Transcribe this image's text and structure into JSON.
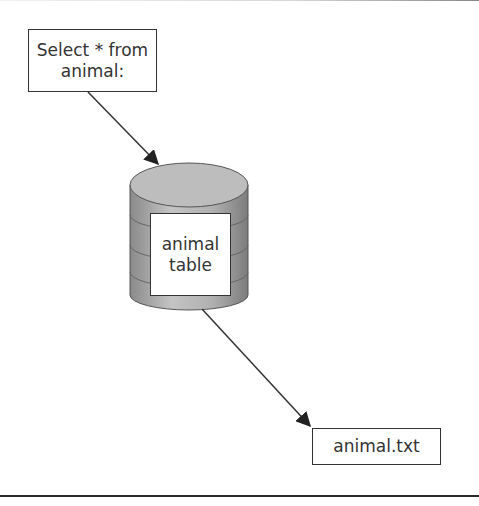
{
  "diagram": {
    "query_box": {
      "line1": "Select * from",
      "line2": "animal:"
    },
    "database": {
      "label_line1": "animal",
      "label_line2": "table",
      "icon": "database-cylinder-icon"
    },
    "output_file": {
      "label": "animal.txt"
    },
    "arrows": [
      {
        "from": "query_box",
        "to": "database"
      },
      {
        "from": "database",
        "to": "output_file"
      }
    ],
    "colors": {
      "line": "#333333",
      "cylinder_top": "#bdbdbd",
      "cylinder_body": "#a8a8a8"
    }
  }
}
